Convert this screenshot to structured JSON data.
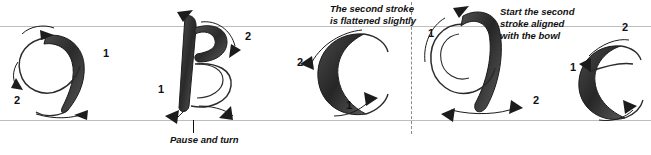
{
  "diagram": {
    "guides": {
      "top_label": "x-height guideline",
      "bottom_label": "baseline guideline"
    },
    "colors": {
      "ink": "#111111",
      "guide_line": "#bdbdbd",
      "dashed_line": "#8a8a8a",
      "stroke_fill": "#2e2e2e"
    },
    "letters": [
      {
        "glyph": "a",
        "name": "letter-a",
        "stroke_numbers": [
          "1",
          "2"
        ]
      },
      {
        "glyph": "B",
        "name": "letter-b",
        "stroke_numbers": [
          "1",
          "2",
          "1"
        ]
      },
      {
        "glyph": "c",
        "name": "letter-c",
        "stroke_numbers": [
          "2",
          "1"
        ]
      },
      {
        "glyph": "d",
        "name": "letter-d",
        "stroke_numbers": [
          "1",
          "2"
        ]
      },
      {
        "glyph": "e",
        "name": "letter-e",
        "stroke_numbers": [
          "1",
          "2"
        ]
      }
    ],
    "annotations": [
      {
        "id": "pause-and-turn",
        "text": "Pause and turn"
      },
      {
        "id": "flattened-slightly",
        "text": "The second stroke\nis flattened slightly"
      },
      {
        "id": "start-aligned-bowl",
        "text": "Start the second\nstroke aligned\nwith the bowl"
      }
    ]
  }
}
